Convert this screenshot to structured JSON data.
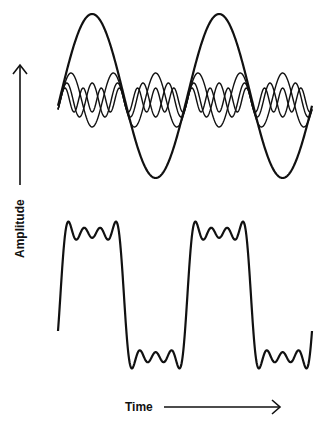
{
  "axes": {
    "y_label": "Amplitude",
    "x_label": "Time"
  },
  "colors": {
    "stroke": "#111111",
    "background": "#ffffff"
  },
  "components_panel": {
    "description": "Fundamental sine wave with 3rd, 5th and 7th harmonics",
    "x_start": 58,
    "x_end": 312,
    "periods": 2,
    "fundamental": {
      "center_y": 96,
      "amplitude": 82,
      "harmonic": 1,
      "stroke_width": 2.2
    },
    "harmonics": [
      {
        "harmonic": 3,
        "center_y": 100,
        "amplitude": 27,
        "stroke_width": 1.4
      },
      {
        "harmonic": 5,
        "center_y": 100,
        "amplitude": 17,
        "stroke_width": 1.4
      },
      {
        "harmonic": 7,
        "center_y": 100,
        "amplitude": 12,
        "stroke_width": 1.4
      }
    ]
  },
  "sum_panel": {
    "description": "Sum of fundamental and harmonics approximating a square wave",
    "x_start": 58,
    "x_end": 312,
    "periods": 2,
    "center_y": 295,
    "amplitude": 62,
    "harmonics_used": [
      1,
      3,
      5,
      7
    ],
    "stroke_width": 2.2
  }
}
